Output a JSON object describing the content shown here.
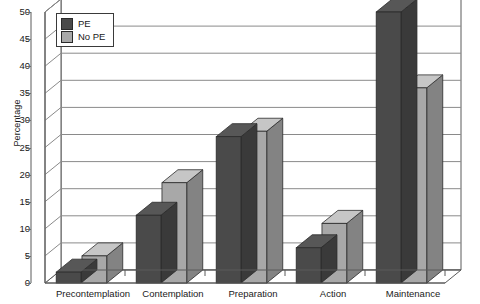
{
  "chart_data": {
    "type": "bar",
    "title": "",
    "subtitle": "",
    "xlabel": "",
    "ylabel": "Percentage",
    "categories": [
      "Precontemplation",
      "Contemplation",
      "Preparation",
      "Action",
      "Maintenance"
    ],
    "series": [
      {
        "name": "PE",
        "color": "#4a4a4a",
        "values": [
          2,
          12.5,
          27,
          6.5,
          50
        ]
      },
      {
        "name": "No PE",
        "color": "#a8a8a8",
        "values": [
          5,
          18.5,
          28,
          11,
          36
        ]
      }
    ],
    "ylim": [
      0,
      50
    ],
    "yticks": [
      0,
      5,
      10,
      15,
      20,
      25,
      30,
      35,
      40,
      45,
      50
    ],
    "ytick_labels": [
      "0",
      "5",
      "10",
      "15",
      "20",
      "25",
      "30",
      "35",
      "40",
      "45",
      "50"
    ],
    "grid": true,
    "grid_axis": "y",
    "legend_position": "top-left",
    "style": "3d-bars",
    "annotations": []
  },
  "legend": {
    "entries": [
      {
        "label": "PE",
        "color": "#4a4a4a"
      },
      {
        "label": "No PE",
        "color": "#a8a8a8"
      }
    ]
  },
  "colors": {
    "pe": "#4a4a4a",
    "no_pe": "#a8a8a8",
    "gridline": "#8a8a8a",
    "axis": "#5a5a5a",
    "background": "#ffffff",
    "text": "#1a1a1a"
  }
}
